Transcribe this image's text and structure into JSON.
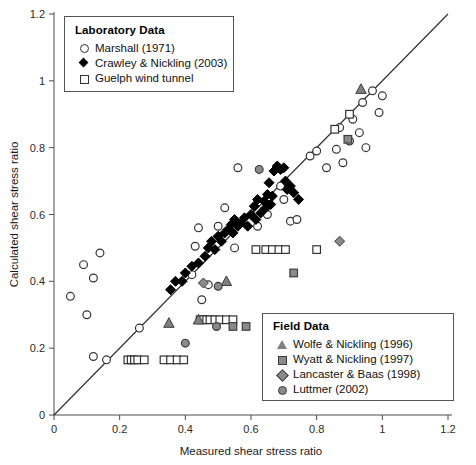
{
  "chart_data": {
    "type": "scatter",
    "title": "",
    "xlabel": "Measured shear stress ratio",
    "ylabel": "Calculated shear stress ratio",
    "xlim": [
      0,
      1.2
    ],
    "ylim": [
      0,
      1.2
    ],
    "xticks": [
      "0",
      "0.2",
      "0.4",
      "0.6",
      "0.8",
      "1",
      "1.2"
    ],
    "yticks": [
      "0",
      "0.2",
      "0.4",
      "0.6",
      "0.8",
      "1",
      "1.2"
    ],
    "grid": false,
    "reference_line": {
      "name": "1:1 line",
      "from": [
        0,
        0
      ],
      "to": [
        1.2,
        1.2
      ]
    },
    "series": [
      {
        "name": "Marshall (1971)",
        "marker": "circle-open",
        "color": "#ffffff",
        "edge": "#333333",
        "group": "Laboratory Data",
        "points": [
          [
            0.05,
            0.355
          ],
          [
            0.09,
            0.45
          ],
          [
            0.1,
            0.3
          ],
          [
            0.12,
            0.41
          ],
          [
            0.12,
            0.175
          ],
          [
            0.14,
            0.485
          ],
          [
            0.16,
            0.165
          ],
          [
            0.26,
            0.26
          ],
          [
            0.42,
            0.42
          ],
          [
            0.43,
            0.505
          ],
          [
            0.44,
            0.56
          ],
          [
            0.45,
            0.345
          ],
          [
            0.47,
            0.39
          ],
          [
            0.5,
            0.565
          ],
          [
            0.52,
            0.62
          ],
          [
            0.55,
            0.5
          ],
          [
            0.56,
            0.74
          ],
          [
            0.62,
            0.565
          ],
          [
            0.65,
            0.6
          ],
          [
            0.69,
            0.685
          ],
          [
            0.7,
            0.645
          ],
          [
            0.72,
            0.58
          ],
          [
            0.74,
            0.585
          ],
          [
            0.78,
            0.775
          ],
          [
            0.8,
            0.79
          ],
          [
            0.83,
            0.74
          ],
          [
            0.86,
            0.795
          ],
          [
            0.87,
            0.86
          ],
          [
            0.88,
            0.755
          ],
          [
            0.9,
            0.82
          ],
          [
            0.91,
            0.885
          ],
          [
            0.93,
            0.845
          ],
          [
            0.94,
            0.935
          ],
          [
            0.95,
            0.8
          ],
          [
            0.97,
            0.97
          ],
          [
            0.99,
            0.905
          ],
          [
            1.0,
            0.955
          ]
        ]
      },
      {
        "name": "Crawley & Nickling (2003)",
        "marker": "diamond-filled",
        "color": "#000000",
        "edge": "#000000",
        "group": "Laboratory Data",
        "points": [
          [
            0.355,
            0.375
          ],
          [
            0.37,
            0.4
          ],
          [
            0.39,
            0.4
          ],
          [
            0.4,
            0.425
          ],
          [
            0.42,
            0.445
          ],
          [
            0.44,
            0.455
          ],
          [
            0.46,
            0.475
          ],
          [
            0.47,
            0.5
          ],
          [
            0.48,
            0.52
          ],
          [
            0.49,
            0.495
          ],
          [
            0.5,
            0.535
          ],
          [
            0.51,
            0.52
          ],
          [
            0.52,
            0.545
          ],
          [
            0.53,
            0.555
          ],
          [
            0.54,
            0.57
          ],
          [
            0.545,
            0.545
          ],
          [
            0.55,
            0.585
          ],
          [
            0.56,
            0.565
          ],
          [
            0.57,
            0.575
          ],
          [
            0.58,
            0.59
          ],
          [
            0.59,
            0.565
          ],
          [
            0.6,
            0.6
          ],
          [
            0.61,
            0.625
          ],
          [
            0.615,
            0.585
          ],
          [
            0.62,
            0.645
          ],
          [
            0.63,
            0.605
          ],
          [
            0.64,
            0.64
          ],
          [
            0.645,
            0.62
          ],
          [
            0.65,
            0.66
          ],
          [
            0.655,
            0.695
          ],
          [
            0.66,
            0.63
          ],
          [
            0.665,
            0.655
          ],
          [
            0.67,
            0.73
          ],
          [
            0.68,
            0.745
          ],
          [
            0.69,
            0.735
          ],
          [
            0.7,
            0.74
          ],
          [
            0.705,
            0.7
          ],
          [
            0.71,
            0.675
          ],
          [
            0.72,
            0.685
          ],
          [
            0.73,
            0.665
          ],
          [
            0.745,
            0.645
          ]
        ]
      },
      {
        "name": "Guelph wind tunnel",
        "marker": "square-open",
        "color": "#ffffff",
        "edge": "#333333",
        "group": "Laboratory Data",
        "points": [
          [
            0.225,
            0.165
          ],
          [
            0.235,
            0.165
          ],
          [
            0.245,
            0.165
          ],
          [
            0.255,
            0.165
          ],
          [
            0.275,
            0.165
          ],
          [
            0.335,
            0.165
          ],
          [
            0.355,
            0.165
          ],
          [
            0.375,
            0.165
          ],
          [
            0.395,
            0.165
          ],
          [
            0.445,
            0.285
          ],
          [
            0.455,
            0.285
          ],
          [
            0.465,
            0.285
          ],
          [
            0.475,
            0.285
          ],
          [
            0.49,
            0.285
          ],
          [
            0.505,
            0.285
          ],
          [
            0.525,
            0.285
          ],
          [
            0.545,
            0.285
          ],
          [
            0.615,
            0.495
          ],
          [
            0.645,
            0.495
          ],
          [
            0.665,
            0.495
          ],
          [
            0.685,
            0.495
          ],
          [
            0.705,
            0.495
          ],
          [
            0.8,
            0.495
          ],
          [
            0.855,
            0.855
          ],
          [
            0.9,
            0.9
          ]
        ]
      },
      {
        "name": "Wolfe & Nickling (1996)",
        "marker": "triangle-gray",
        "color": "#808080",
        "edge": "#3c3c3c",
        "group": "Field Data",
        "points": [
          [
            0.35,
            0.275
          ],
          [
            0.44,
            0.285
          ],
          [
            0.525,
            0.4
          ],
          [
            0.935,
            0.975
          ]
        ]
      },
      {
        "name": "Wyatt & Nickling (1997)",
        "marker": "square-gray",
        "color": "#8a8a8a",
        "edge": "#3c3c3c",
        "group": "Field Data",
        "points": [
          [
            0.545,
            0.265
          ],
          [
            0.585,
            0.265
          ],
          [
            0.73,
            0.425
          ],
          [
            0.895,
            0.825
          ]
        ]
      },
      {
        "name": "Lancaster & Baas (1998)",
        "marker": "diamond-gray",
        "color": "#8a8a8a",
        "edge": "#3c3c3c",
        "group": "Field Data",
        "points": [
          [
            0.455,
            0.395
          ],
          [
            0.87,
            0.52
          ]
        ]
      },
      {
        "name": "Luttmer (2002)",
        "marker": "circle-gray",
        "color": "#8a8a8a",
        "edge": "#3c3c3c",
        "group": "Field Data",
        "points": [
          [
            0.4,
            0.215
          ],
          [
            0.495,
            0.265
          ],
          [
            0.5,
            0.385
          ],
          [
            0.625,
            0.735
          ]
        ]
      }
    ]
  },
  "legends": {
    "laboratory": {
      "title": "Laboratory Data",
      "entries": [
        {
          "label": "Marshall (1971)",
          "symbol": "circle-open"
        },
        {
          "label": "Crawley & Nickling (2003)",
          "symbol": "diamond-filled"
        },
        {
          "label": "Guelph wind tunnel",
          "symbol": "square-open"
        }
      ]
    },
    "field": {
      "title": "Field Data",
      "entries": [
        {
          "label": "Wolfe & Nickling (1996)",
          "symbol": "triangle-gray"
        },
        {
          "label": "Wyatt & Nickling (1997)",
          "symbol": "square-gray"
        },
        {
          "label": "Lancaster & Baas (1998)",
          "symbol": "diamond-gray"
        },
        {
          "label": "Luttmer (2002)",
          "symbol": "circle-gray"
        }
      ]
    }
  }
}
